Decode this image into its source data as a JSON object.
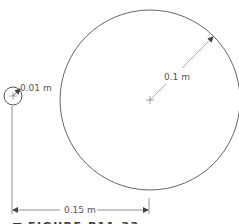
{
  "diagram": {
    "small_circle": {
      "label": "0.01 m",
      "cx": 13,
      "cy": 96,
      "r": 9
    },
    "large_circle": {
      "label": "0.1 m",
      "cx": 150,
      "cy": 100,
      "r": 90
    },
    "separation": {
      "label": "0.15 m"
    },
    "caption": {
      "marker": "■",
      "text": "FIGURE P11.33"
    },
    "colors": {
      "line": "#555555",
      "thin": "#8a8a8a",
      "caption": "#3a3a3a"
    }
  }
}
